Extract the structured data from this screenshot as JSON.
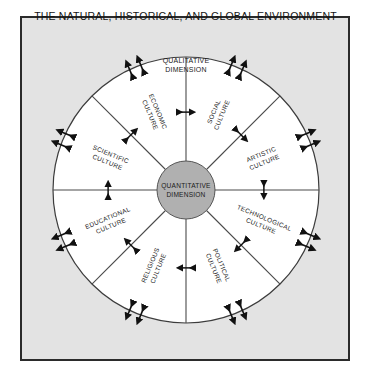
{
  "figure": {
    "title": "THE NATURAL, HISTORICAL, AND GLOBAL ENVIRONMENT",
    "background_color": "#e3e3e3",
    "border_color": "#2b2b2b",
    "circle_fill": "#ffffff",
    "hub_fill": "#b0b0b0",
    "line_color": "#4a4a4a",
    "text_color": "#1a1a1a"
  },
  "hub": {
    "line1": "QUANTITATIVE",
    "line2": "DIMENSION"
  },
  "top_axis": {
    "line1": "QUALITATIVE",
    "line2": "DIMENSION"
  },
  "wedges": [
    {
      "id": "social-culture",
      "line1": "SOCIAL",
      "line2": "CULTURE",
      "angle_deg": 22.5
    },
    {
      "id": "artistic-culture",
      "line1": "ARTISTIC",
      "line2": "CULTURE",
      "angle_deg": 67.5
    },
    {
      "id": "technological-culture",
      "line1": "TECHNOLOGICAL",
      "line2": "CULTURE",
      "angle_deg": 112.5
    },
    {
      "id": "political-culture",
      "line1": "POLITICAL",
      "line2": "CULTURE",
      "angle_deg": 157.5
    },
    {
      "id": "religious-culture",
      "line1": "RELIGIOUS",
      "line2": "CULTURE",
      "angle_deg": 202.5
    },
    {
      "id": "educational-culture",
      "line1": "EDUCATIONAL",
      "line2": "CULTURE",
      "angle_deg": 247.5
    },
    {
      "id": "scientific-culture",
      "line1": "SCIENTIFIC",
      "line2": "CULTURE",
      "angle_deg": 292.5
    },
    {
      "id": "economic-culture",
      "line1": "ECONOMIC",
      "line2": "CULTURE",
      "angle_deg": 337.5
    }
  ],
  "spokes": {
    "count": 8,
    "angles_deg": [
      0,
      45,
      90,
      135,
      180,
      225,
      270,
      315
    ],
    "marker": "double-headed-arrow"
  },
  "boundary_markers": {
    "count": 8,
    "angles_deg": [
      22.5,
      67.5,
      112.5,
      157.5,
      202.5,
      247.5,
      292.5,
      337.5
    ],
    "marker": "double-headed-arrow-pair"
  },
  "geometry": {
    "center_x": 166,
    "center_y": 174,
    "outer_radius": 133,
    "hub_radius": 29
  }
}
